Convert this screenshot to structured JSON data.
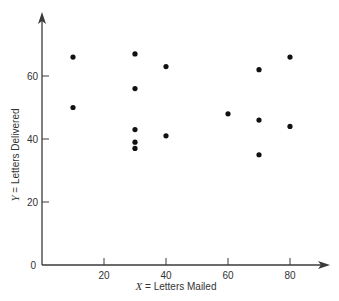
{
  "chart_data": {
    "type": "scatter",
    "title": "",
    "xlabel": "X = Letters Mailed",
    "ylabel": "Y = Letters Delivered",
    "xlabel_var": "X",
    "xlabel_text": " = Letters Mailed",
    "ylabel_var": "Y",
    "ylabel_text": " = Letters Delivered",
    "xlim": [
      0,
      90
    ],
    "ylim": [
      0,
      70
    ],
    "x_ticks": [
      20,
      40,
      60,
      80
    ],
    "y_ticks": [
      20,
      40,
      60
    ],
    "origin_label": "0",
    "grid": false,
    "legend": null,
    "points": [
      {
        "x": 10,
        "y": 66
      },
      {
        "x": 10,
        "y": 50
      },
      {
        "x": 30,
        "y": 67
      },
      {
        "x": 30,
        "y": 56
      },
      {
        "x": 30,
        "y": 43
      },
      {
        "x": 30,
        "y": 39
      },
      {
        "x": 30,
        "y": 37
      },
      {
        "x": 40,
        "y": 63
      },
      {
        "x": 40,
        "y": 41
      },
      {
        "x": 60,
        "y": 48
      },
      {
        "x": 70,
        "y": 62
      },
      {
        "x": 70,
        "y": 46
      },
      {
        "x": 70,
        "y": 35
      },
      {
        "x": 80,
        "y": 66
      },
      {
        "x": 80,
        "y": 44
      }
    ]
  },
  "style": {
    "axis_color": "#3a3a3a",
    "point_color": "#111111"
  }
}
